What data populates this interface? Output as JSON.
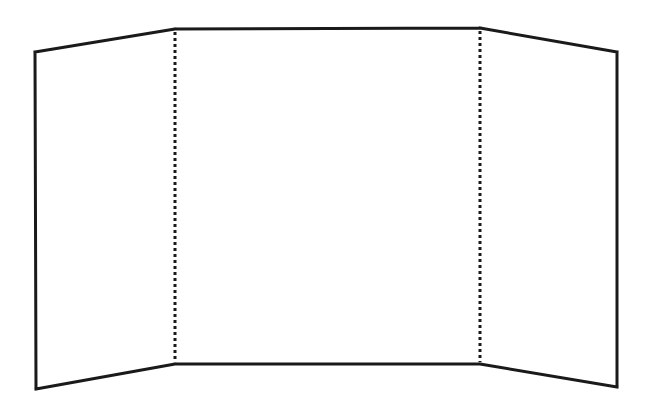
{
  "diagram": {
    "type": "tri-fold display board outline",
    "stroke_color": "#1a1a1a",
    "background": "#ffffff",
    "panels": [
      {
        "name": "left-panel",
        "points": [
          [
            35,
            52
          ],
          [
            175,
            29
          ],
          [
            175,
            364
          ],
          [
            36,
            389
          ]
        ]
      },
      {
        "name": "center-panel",
        "points": [
          [
            175,
            29
          ],
          [
            480,
            28
          ],
          [
            480,
            364
          ],
          [
            175,
            364
          ]
        ]
      },
      {
        "name": "right-panel",
        "points": [
          [
            480,
            28
          ],
          [
            617,
            52
          ],
          [
            617,
            387
          ],
          [
            480,
            364
          ]
        ]
      }
    ],
    "fold_lines": [
      {
        "name": "left-fold",
        "x": 175,
        "y1": 29,
        "y2": 364,
        "style": "dotted"
      },
      {
        "name": "right-fold",
        "x": 480,
        "y1": 28,
        "y2": 364,
        "style": "dotted"
      }
    ]
  }
}
